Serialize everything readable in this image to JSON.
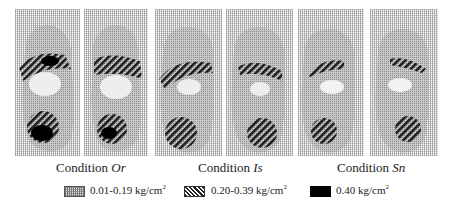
{
  "figure": {
    "conditions": [
      {
        "label_prefix": "Condition ",
        "label_code": "Or"
      },
      {
        "label_prefix": "Condition ",
        "label_code": "Is"
      },
      {
        "label_prefix": "Condition ",
        "label_code": "Sn"
      }
    ],
    "legend": [
      {
        "label": "0.01-0.19 kg/cm",
        "sup": "2",
        "pattern": "dotted-grid",
        "color": "#bbbbbb"
      },
      {
        "label": "0.20-0.39 kg/cm",
        "sup": "2",
        "pattern": "diagonal-hatch",
        "color": "#222222"
      },
      {
        "label": "0.40 kg/cm",
        "sup": "2",
        "pattern": "solid",
        "color": "#000000"
      }
    ],
    "panels": [
      {
        "condition": "Or",
        "foot": "left"
      },
      {
        "condition": "Or",
        "foot": "right"
      },
      {
        "condition": "Is",
        "foot": "left"
      },
      {
        "condition": "Is",
        "foot": "right"
      },
      {
        "condition": "Sn",
        "foot": "left"
      },
      {
        "condition": "Sn",
        "foot": "right"
      }
    ]
  }
}
